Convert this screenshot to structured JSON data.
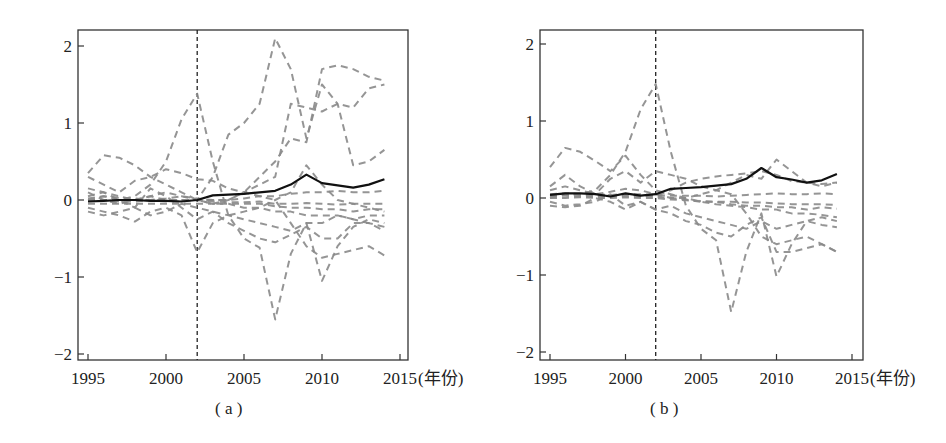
{
  "chart_data": [
    {
      "id": "a",
      "type": "line",
      "caption": "( a )",
      "title": "",
      "xlabel": "(年份)",
      "ylabel": "",
      "xlim": [
        1994.5,
        2015.3
      ],
      "ylim": [
        -2.1,
        2.2
      ],
      "xticks": [
        1995,
        2000,
        2005,
        2010,
        2015
      ],
      "xtick_labels": [
        "1995",
        "2000",
        "2005",
        "2010",
        "2015"
      ],
      "yticks": [
        -2,
        -1,
        0,
        1,
        2
      ],
      "ytick_labels": [
        "-2",
        "-1",
        "0",
        "1",
        "2"
      ],
      "grid": false,
      "legend": null,
      "annotations": [
        {
          "type": "vline",
          "x": 2002,
          "style": "dashed",
          "color": "#222222"
        }
      ],
      "x": [
        1995,
        1996,
        1997,
        1998,
        1999,
        2000,
        2001,
        2002,
        2003,
        2004,
        2005,
        2006,
        2007,
        2008,
        2009,
        2010,
        2011,
        2012,
        2013,
        2014
      ],
      "series": [
        {
          "name": "treated",
          "style": "solid",
          "color": "#111111",
          "values": [
            -0.02,
            -0.01,
            0.0,
            0.0,
            -0.01,
            -0.01,
            -0.02,
            0.0,
            0.06,
            0.07,
            0.08,
            0.1,
            0.12,
            0.2,
            0.33,
            0.22,
            0.19,
            0.16,
            0.2,
            0.27
          ]
        },
        {
          "name": "control-1",
          "style": "dashed",
          "color": "#8a8a8a",
          "values": [
            0.0,
            0.0,
            0.0,
            0.05,
            0.2,
            0.5,
            1.05,
            1.38,
            0.5,
            -0.2,
            -0.5,
            -0.62,
            -1.55,
            -0.7,
            -0.3,
            -1.05,
            -0.6,
            -0.35,
            -0.25,
            -0.3
          ]
        },
        {
          "name": "control-2",
          "style": "dashed",
          "color": "#8a8a8a",
          "values": [
            0.1,
            0.0,
            -0.05,
            0.0,
            0.0,
            0.0,
            0.0,
            0.0,
            0.3,
            0.85,
            1.0,
            1.25,
            2.1,
            1.7,
            0.8,
            1.5,
            1.25,
            0.45,
            0.5,
            0.65
          ]
        },
        {
          "name": "control-3",
          "style": "dashed",
          "color": "#8a8a8a",
          "values": [
            0.35,
            0.58,
            0.55,
            0.45,
            0.3,
            0.2,
            0.1,
            0.0,
            -0.05,
            0.0,
            0.1,
            0.3,
            0.5,
            0.8,
            0.75,
            1.7,
            1.75,
            1.7,
            1.6,
            1.55
          ]
        },
        {
          "name": "control-4",
          "style": "dashed",
          "color": "#8a8a8a",
          "values": [
            0.0,
            0.05,
            0.0,
            0.0,
            0.05,
            0.0,
            0.0,
            0.0,
            0.0,
            0.0,
            0.1,
            0.2,
            0.3,
            1.25,
            1.2,
            1.15,
            1.25,
            1.2,
            1.45,
            1.5
          ]
        },
        {
          "name": "control-5",
          "style": "dashed",
          "color": "#8a8a8a",
          "values": [
            0.3,
            0.2,
            0.1,
            0.25,
            0.3,
            0.4,
            0.35,
            0.27,
            0.25,
            0.15,
            0.1,
            0.05,
            0.0,
            -0.3,
            -0.6,
            -0.75,
            -0.7,
            -0.65,
            -0.6,
            -0.72
          ]
        },
        {
          "name": "control-6",
          "style": "dashed",
          "color": "#8a8a8a",
          "values": [
            0.15,
            0.1,
            0.0,
            -0.1,
            0.15,
            0.05,
            -0.1,
            -0.25,
            -0.15,
            -0.3,
            -0.4,
            -0.5,
            -0.55,
            -0.45,
            -0.35,
            -0.5,
            -0.5,
            -0.3,
            -0.3,
            -0.35
          ]
        },
        {
          "name": "control-7",
          "style": "dashed",
          "color": "#8a8a8a",
          "values": [
            -0.1,
            -0.15,
            -0.2,
            -0.28,
            -0.15,
            -0.1,
            -0.2,
            -0.68,
            -0.3,
            -0.2,
            -0.15,
            -0.1,
            0.0,
            0.1,
            0.45,
            0.2,
            0.0,
            -0.05,
            -0.1,
            -0.15
          ]
        },
        {
          "name": "control-8",
          "style": "dashed",
          "color": "#8a8a8a",
          "values": [
            -0.15,
            -0.2,
            -0.15,
            -0.1,
            -0.2,
            -0.15,
            -0.05,
            -0.1,
            -0.15,
            -0.2,
            -0.25,
            -0.3,
            -0.35,
            -0.4,
            -0.3,
            -0.3,
            -0.2,
            -0.25,
            -0.3,
            -0.4
          ]
        },
        {
          "name": "control-9",
          "style": "dashed",
          "color": "#8a8a8a",
          "values": [
            0.05,
            0.1,
            0.05,
            0.0,
            0.05,
            0.1,
            0.05,
            0.0,
            -0.05,
            -0.05,
            -0.1,
            -0.1,
            -0.15,
            -0.15,
            -0.2,
            -0.2,
            -0.2,
            -0.25,
            -0.2,
            -0.2
          ]
        },
        {
          "name": "control-10",
          "style": "dashed",
          "color": "#8a8a8a",
          "values": [
            -0.05,
            -0.05,
            -0.05,
            -0.05,
            -0.05,
            -0.05,
            -0.05,
            -0.05,
            -0.05,
            -0.05,
            -0.05,
            -0.05,
            -0.08,
            -0.1,
            -0.1,
            -0.12,
            -0.12,
            -0.15,
            -0.12,
            -0.12
          ]
        },
        {
          "name": "control-11",
          "style": "dashed",
          "color": "#8a8a8a",
          "values": [
            0.02,
            0.05,
            0.03,
            0.02,
            0.0,
            0.02,
            0.05,
            0.02,
            0.0,
            0.0,
            0.02,
            0.05,
            0.05,
            0.08,
            0.1,
            0.1,
            0.12,
            0.1,
            0.1,
            0.12
          ]
        },
        {
          "name": "control-12",
          "style": "dashed",
          "color": "#8a8a8a",
          "values": [
            0.0,
            0.0,
            -0.02,
            -0.02,
            0.0,
            -0.02,
            -0.02,
            0.0,
            -0.02,
            -0.03,
            -0.03,
            -0.02,
            -0.05,
            -0.05,
            -0.04,
            -0.05,
            -0.06,
            -0.05,
            -0.05,
            -0.05
          ]
        }
      ]
    },
    {
      "id": "b",
      "type": "line",
      "caption": "( b )",
      "title": "",
      "xlabel": "(年份)",
      "ylabel": "",
      "xlim": [
        1994.5,
        2015.3
      ],
      "ylim": [
        -2.1,
        2.2
      ],
      "xticks": [
        1995,
        2000,
        2005,
        2010,
        2015
      ],
      "xtick_labels": [
        "1995",
        "2000",
        "2005",
        "2010",
        "2015"
      ],
      "yticks": [
        -2,
        -1,
        0,
        1,
        2
      ],
      "ytick_labels": [
        "-2",
        "-1",
        "0",
        "1",
        "2"
      ],
      "grid": false,
      "legend": null,
      "annotations": [
        {
          "type": "vline",
          "x": 2002,
          "style": "dashed",
          "color": "#222222"
        }
      ],
      "x": [
        1995,
        1996,
        1997,
        1998,
        1999,
        2000,
        2001,
        2002,
        2003,
        2004,
        2005,
        2006,
        2007,
        2008,
        2009,
        2010,
        2011,
        2012,
        2013,
        2014
      ],
      "series": [
        {
          "name": "treated",
          "style": "solid",
          "color": "#111111",
          "values": [
            0.04,
            0.06,
            0.06,
            0.05,
            0.02,
            0.06,
            0.03,
            0.05,
            0.12,
            0.13,
            0.14,
            0.16,
            0.18,
            0.25,
            0.39,
            0.27,
            0.24,
            0.2,
            0.23,
            0.31
          ]
        },
        {
          "name": "control-1",
          "style": "dashed",
          "color": "#8a8a8a",
          "values": [
            0.0,
            0.05,
            0.05,
            0.1,
            0.3,
            0.6,
            1.15,
            1.48,
            0.6,
            -0.1,
            -0.4,
            -0.55,
            -1.48,
            -0.7,
            -0.2,
            -1.02,
            -0.6,
            -0.3,
            -0.25,
            -0.3
          ]
        },
        {
          "name": "control-2",
          "style": "dashed",
          "color": "#8a8a8a",
          "values": [
            0.4,
            0.65,
            0.6,
            0.48,
            0.35,
            0.55,
            0.3,
            0.1,
            0.05,
            0.0,
            0.05,
            0.1,
            0.2,
            0.3,
            0.25,
            0.5,
            0.35,
            0.2,
            0.15,
            0.2
          ]
        },
        {
          "name": "control-3",
          "style": "dashed",
          "color": "#8a8a8a",
          "values": [
            0.15,
            0.3,
            0.15,
            0.05,
            0.25,
            0.35,
            0.2,
            0.35,
            0.3,
            0.25,
            0.15,
            0.1,
            0.05,
            -0.2,
            -0.5,
            -0.6,
            -0.55,
            -0.5,
            -0.6,
            -0.7
          ]
        },
        {
          "name": "control-4",
          "style": "dashed",
          "color": "#8a8a8a",
          "values": [
            -0.05,
            -0.1,
            -0.08,
            -0.05,
            0.05,
            -0.1,
            -0.05,
            -0.15,
            -0.2,
            -0.3,
            -0.35,
            -0.45,
            -0.5,
            -0.35,
            -0.25,
            -0.7,
            -0.7,
            -0.65,
            -0.6,
            -0.7
          ]
        },
        {
          "name": "control-5",
          "style": "dashed",
          "color": "#8a8a8a",
          "values": [
            -0.1,
            -0.12,
            -0.1,
            0.0,
            -0.05,
            -0.15,
            -0.05,
            -0.15,
            -0.1,
            -0.2,
            -0.25,
            -0.3,
            -0.35,
            -0.4,
            -0.3,
            -0.4,
            -0.35,
            -0.3,
            -0.35,
            -0.38
          ]
        },
        {
          "name": "control-6",
          "style": "dashed",
          "color": "#8a8a8a",
          "values": [
            0.1,
            0.15,
            0.1,
            0.05,
            0.08,
            0.12,
            0.1,
            0.05,
            0.0,
            0.0,
            -0.05,
            -0.08,
            -0.1,
            -0.12,
            -0.15,
            -0.15,
            -0.2,
            -0.2,
            -0.22,
            -0.25
          ]
        },
        {
          "name": "control-7",
          "style": "dashed",
          "color": "#8a8a8a",
          "values": [
            0.02,
            0.05,
            0.04,
            0.03,
            0.02,
            0.04,
            0.03,
            0.02,
            0.0,
            -0.02,
            -0.05,
            -0.05,
            -0.08,
            -0.1,
            -0.1,
            -0.12,
            -0.12,
            -0.15,
            -0.12,
            -0.14
          ]
        },
        {
          "name": "control-8",
          "style": "dashed",
          "color": "#8a8a8a",
          "values": [
            0.05,
            0.06,
            0.05,
            0.05,
            0.04,
            0.05,
            0.05,
            0.04,
            0.03,
            0.03,
            0.03,
            0.02,
            0.03,
            0.04,
            0.05,
            0.06,
            0.05,
            0.05,
            0.06,
            0.05
          ]
        },
        {
          "name": "control-9",
          "style": "dashed",
          "color": "#8a8a8a",
          "values": [
            0.03,
            0.03,
            0.02,
            0.02,
            0.03,
            0.02,
            0.02,
            0.03,
            0.1,
            0.2,
            0.25,
            0.28,
            0.3,
            0.32,
            0.35,
            0.3,
            0.22,
            0.2,
            0.18,
            0.2
          ]
        },
        {
          "name": "control-10",
          "style": "dashed",
          "color": "#8a8a8a",
          "values": [
            0.0,
            0.0,
            0.01,
            0.0,
            0.0,
            0.01,
            0.0,
            0.0,
            -0.02,
            -0.03,
            -0.04,
            -0.05,
            -0.05,
            -0.06,
            -0.06,
            -0.07,
            -0.08,
            -0.08,
            -0.08,
            -0.09
          ]
        }
      ]
    }
  ],
  "panels": {
    "a": {
      "caption": "( a )",
      "x_unit": "(年份)"
    },
    "b": {
      "caption": "( b )",
      "x_unit": "(年份)"
    }
  }
}
